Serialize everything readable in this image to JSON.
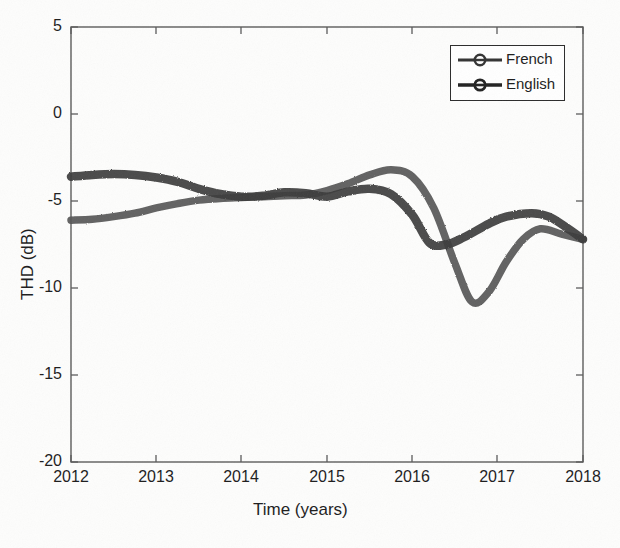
{
  "chart_data": {
    "type": "line",
    "title": "",
    "xlabel": "Time (years)",
    "ylabel": "THD (dB)",
    "xlim": [
      2012,
      2018
    ],
    "ylim": [
      -20,
      5
    ],
    "xticks": [
      "2012",
      "2013",
      "2014",
      "2015",
      "2016",
      "2017",
      "2018"
    ],
    "yticks": [
      "5",
      "0",
      "-5",
      "-10",
      "-15",
      "-20"
    ],
    "grid": false,
    "legend_position": "top-right",
    "series": [
      {
        "name": "French",
        "color": "#555555",
        "marker": "circle",
        "x": [
          2012.0,
          2012.25,
          2012.5,
          2012.75,
          2013.0,
          2013.25,
          2013.5,
          2013.75,
          2014.0,
          2014.25,
          2014.5,
          2014.75,
          2015.0,
          2015.25,
          2015.5,
          2015.75,
          2016.0,
          2016.25,
          2016.5,
          2016.7,
          2016.9,
          2017.1,
          2017.3,
          2017.5,
          2017.75,
          2018.0
        ],
        "values": [
          -6.1,
          -6.05,
          -5.9,
          -5.7,
          -5.4,
          -5.15,
          -4.95,
          -4.85,
          -4.8,
          -4.75,
          -4.7,
          -4.65,
          -4.4,
          -4.0,
          -3.5,
          -3.2,
          -3.6,
          -5.4,
          -8.6,
          -10.8,
          -10.2,
          -8.5,
          -7.2,
          -6.6,
          -6.9,
          -7.2
        ]
      },
      {
        "name": "English",
        "color": "#3a3a3a",
        "marker": "circle",
        "x": [
          2012.0,
          2012.25,
          2012.5,
          2012.75,
          2013.0,
          2013.25,
          2013.5,
          2013.75,
          2014.0,
          2014.25,
          2014.5,
          2014.75,
          2015.0,
          2015.25,
          2015.5,
          2015.75,
          2016.0,
          2016.2,
          2016.4,
          2016.6,
          2016.9,
          2017.1,
          2017.4,
          2017.6,
          2017.8,
          2018.0
        ],
        "values": [
          -3.6,
          -3.5,
          -3.45,
          -3.5,
          -3.65,
          -3.9,
          -4.3,
          -4.6,
          -4.75,
          -4.7,
          -4.5,
          -4.55,
          -4.75,
          -4.45,
          -4.3,
          -4.6,
          -5.8,
          -7.4,
          -7.5,
          -7.1,
          -6.3,
          -5.9,
          -5.7,
          -5.9,
          -6.5,
          -7.2
        ]
      }
    ],
    "crossings": [
      2015.85,
      2017.25
    ],
    "french_min": {
      "x": 2016.7,
      "y": -10.8
    },
    "french_max": {
      "x": 2015.75,
      "y": -3.2
    },
    "english_min": {
      "x": 2016.4,
      "y": -7.5
    }
  },
  "legend": {
    "entries": [
      {
        "label": "French",
        "icon": "line-circle-marker"
      },
      {
        "label": "English",
        "icon": "line-circle-marker"
      }
    ]
  },
  "axes": {
    "xlabel": "Time (years)",
    "ylabel": "THD (dB)",
    "xticks": [
      "2012",
      "2013",
      "2014",
      "2015",
      "2016",
      "2017",
      "2018"
    ],
    "yticks": [
      "5",
      "0",
      "-5",
      "-10",
      "-15",
      "-20"
    ]
  }
}
